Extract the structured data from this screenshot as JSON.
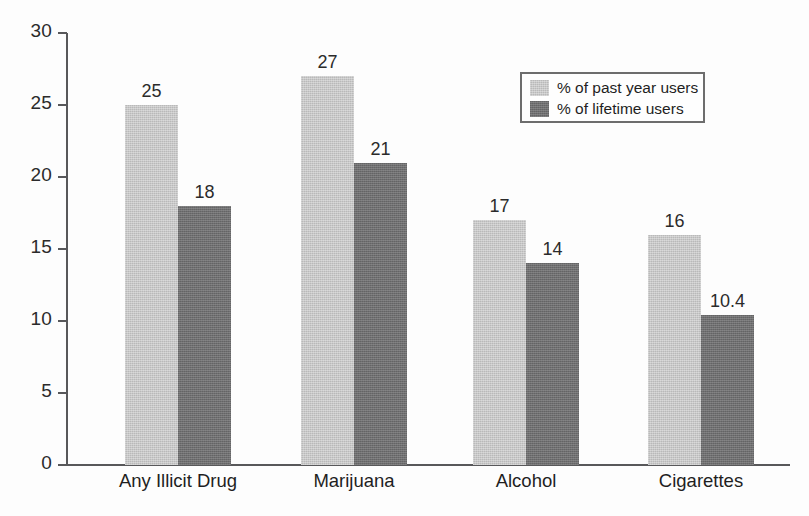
{
  "chart_data": {
    "type": "bar",
    "title": "",
    "subtitle": "",
    "xlabel": "",
    "ylabel": "",
    "ylim": [
      0,
      30
    ],
    "yticks": [
      "0",
      "5",
      "10",
      "15",
      "20",
      "25",
      "30"
    ],
    "grid": false,
    "legend_position": "upper-right",
    "categories": [
      "Any Illicit Drug",
      "Marijuana",
      "Alcohol",
      "Cigarettes"
    ],
    "series": [
      {
        "name": "% of past year users",
        "color": "#b9b9b9",
        "values": [
          25,
          27,
          17,
          16
        ],
        "labels": [
          "25",
          "27",
          "17",
          "16"
        ]
      },
      {
        "name": "% of lifetime users",
        "color": "#6f6f70",
        "values": [
          18,
          21,
          14,
          10.4
        ],
        "labels": [
          "18",
          "21",
          "14",
          "10.4"
        ]
      }
    ]
  },
  "axis": {
    "line_color": "#58585a"
  }
}
